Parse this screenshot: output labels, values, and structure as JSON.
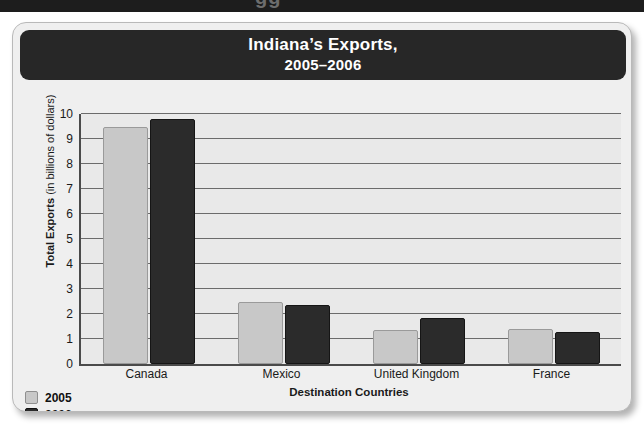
{
  "page": {
    "top_strip_ghost_text": "gg"
  },
  "figure": {
    "title_line1": "Indiana’s Exports,",
    "title_line2": "2005–2006"
  },
  "chart_data": {
    "type": "bar",
    "title": "Indiana’s Exports, 2005–2006",
    "xlabel": "Destination Countries",
    "ylabel": "Total Exports (in billions of dollars)",
    "ylabel_bold_part": "Total Exports",
    "ylabel_plain_part": " (in billions of dollars)",
    "categories": [
      "Canada",
      "Mexico",
      "United Kingdom",
      "France"
    ],
    "series": [
      {
        "name": "2005",
        "color": "#c8c8c8",
        "values": [
          9.5,
          2.5,
          1.35,
          1.4
        ]
      },
      {
        "name": "2006",
        "color": "#2b2b2b",
        "values": [
          9.8,
          2.35,
          1.85,
          1.3
        ]
      }
    ],
    "ylim": [
      0,
      10
    ],
    "yticks": [
      10,
      9,
      8,
      7,
      6,
      5,
      4,
      3,
      2,
      1,
      0
    ],
    "grid": true,
    "legend_position": "bottom-left"
  }
}
